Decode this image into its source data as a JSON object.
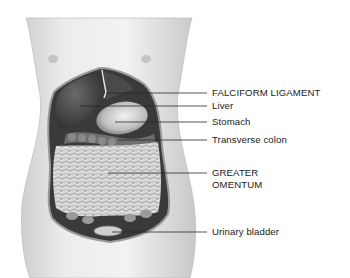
{
  "diagram": {
    "labels": [
      {
        "id": "falciform-ligament",
        "text": "FALCIFORM LIGAMENT",
        "y": 87
      },
      {
        "id": "liver",
        "text": "Liver",
        "y": 100
      },
      {
        "id": "stomach",
        "text": "Stomach",
        "y": 115
      },
      {
        "id": "transverse-colon",
        "text": "Transverse colon",
        "y": 133
      },
      {
        "id": "greater-omentum",
        "text": "GREATER",
        "text2": "OMENTUM",
        "y": 167
      },
      {
        "id": "urinary-bladder",
        "text": "Urinary bladder",
        "y": 226
      }
    ]
  }
}
